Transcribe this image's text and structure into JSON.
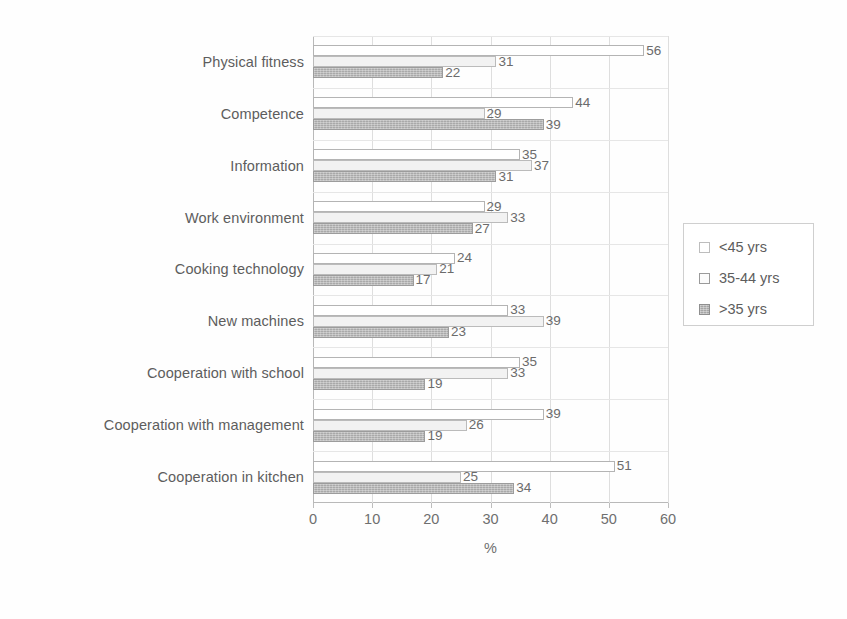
{
  "chart_data": {
    "type": "bar",
    "orientation": "horizontal",
    "title": "",
    "xlabel": "%",
    "ylabel": "",
    "xlim": [
      0,
      60
    ],
    "xticks": [
      0,
      10,
      20,
      30,
      40,
      50,
      60
    ],
    "grid": true,
    "legend_position": "right",
    "categories": [
      "Physical fitness",
      "Competence",
      "Information",
      "Work environment",
      "Cooking technology",
      "New machines",
      "Cooperation with school",
      "Cooperation with management",
      "Cooperation in kitchen"
    ],
    "series": [
      {
        "name": "<45 yrs",
        "values": [
          56,
          44,
          35,
          29,
          24,
          33,
          35,
          39,
          51
        ]
      },
      {
        "name": "35-44 yrs",
        "values": [
          31,
          29,
          37,
          33,
          21,
          39,
          33,
          26,
          25
        ]
      },
      {
        "name": ">35 yrs",
        "values": [
          22,
          39,
          31,
          27,
          17,
          23,
          19,
          19,
          34
        ]
      }
    ]
  },
  "legend": {
    "items": [
      {
        "label": "<45 yrs",
        "swatch": "open-square-icon"
      },
      {
        "label": "35-44 yrs",
        "swatch": "open-square-icon"
      },
      {
        "label": ">35 yrs",
        "swatch": "filled-square-icon"
      }
    ]
  }
}
